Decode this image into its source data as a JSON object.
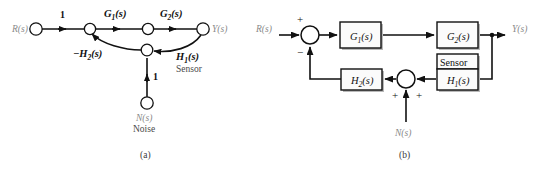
{
  "figure": {
    "background_color": "#ffffff",
    "line_color": "#111111",
    "label_gray": "#8a8a8a"
  },
  "panel_a": {
    "caption": "(a)",
    "type": "signal-flow-graph",
    "nodes": [
      {
        "id": "R",
        "label": "R(s)",
        "x": 36,
        "y": 29
      },
      {
        "id": "E",
        "label": "",
        "x": 90,
        "y": 29
      },
      {
        "id": "M",
        "label": "",
        "x": 148,
        "y": 29
      },
      {
        "id": "Y",
        "label": "Y(s)",
        "x": 203,
        "y": 29
      },
      {
        "id": "F",
        "label": "",
        "x": 147,
        "y": 50
      },
      {
        "id": "N",
        "label": "N(s)",
        "x": 147,
        "y": 103
      }
    ],
    "edge_labels": {
      "input_gain": "1",
      "g1": "G",
      "g1_sub": "1",
      "g1_suffix": "(s)",
      "g2": "G",
      "g2_sub": "2",
      "g2_suffix": "(s)",
      "h2": "−H",
      "h2_sub": "2",
      "h2_suffix": "(s)",
      "h1": "H",
      "h1_sub": "1",
      "h1_suffix": "(s)",
      "noise_gain": "1"
    },
    "annotations": {
      "sensor": "Sensor",
      "noise": "Noise"
    },
    "output_label": "Y(s)",
    "input_label": "R(s)",
    "noise_label": "N(s)"
  },
  "panel_b": {
    "caption": "(b)",
    "type": "block-diagram",
    "input_label": "R(s)",
    "output_label": "Y(s)",
    "noise_label": "N(s)",
    "blocks": [
      {
        "id": "G1",
        "name": "G",
        "sub": "1",
        "suffix": "(s)",
        "x": 340,
        "y": 22,
        "w": 41,
        "h": 26
      },
      {
        "id": "G2",
        "name": "G",
        "sub": "2",
        "suffix": "(s)",
        "x": 437,
        "y": 22,
        "w": 41,
        "h": 26
      },
      {
        "id": "H2",
        "name": "H",
        "sub": "2",
        "suffix": "(s)",
        "x": 341,
        "y": 69,
        "w": 41,
        "h": 21
      },
      {
        "id": "H1",
        "name": "H",
        "sub": "1",
        "suffix": "(s)",
        "x": 437,
        "y": 69,
        "w": 41,
        "h": 21
      }
    ],
    "sensor_box": {
      "label": "Sensor",
      "x": 437,
      "y": 54,
      "w": 41,
      "h": 15
    },
    "summers": [
      {
        "id": "input-summer",
        "x": 310,
        "y": 35,
        "r": 9,
        "signs": [
          {
            "sign": "+",
            "x": 300,
            "y": 20
          },
          {
            "sign": "−",
            "x": 300,
            "y": 52
          }
        ]
      },
      {
        "id": "noise-summer",
        "x": 406,
        "y": 79,
        "r": 9,
        "signs": [
          {
            "sign": "+",
            "x": 395,
            "y": 97
          },
          {
            "sign": "+",
            "x": 418,
            "y": 97
          }
        ]
      }
    ]
  }
}
